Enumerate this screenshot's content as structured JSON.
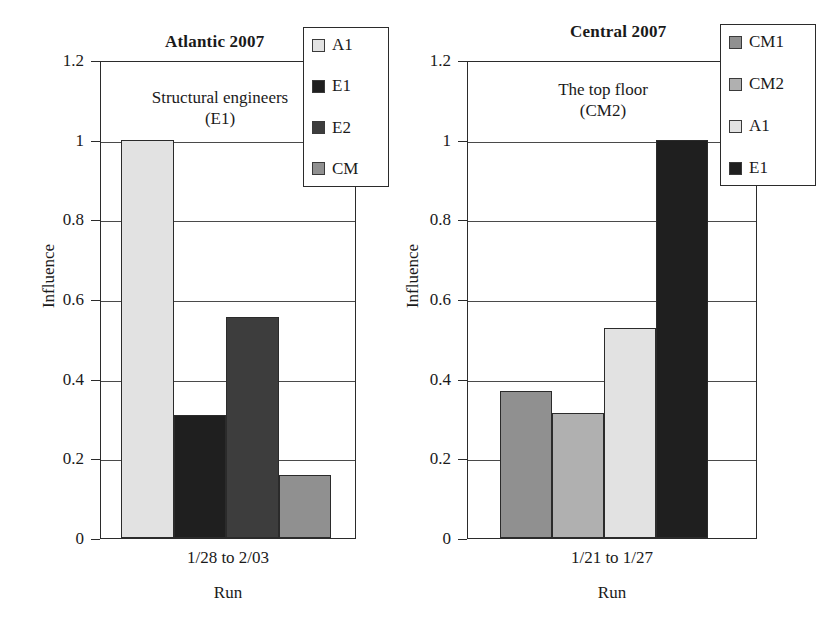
{
  "figure": {
    "background": "#ffffff",
    "panels": [
      "atlantic",
      "central"
    ]
  },
  "chart_data": [
    {
      "type": "bar",
      "title": "Atlantic 2007",
      "xlabel": "Run",
      "ylabel": "Influence",
      "categories": [
        "1/28 to 2/03"
      ],
      "x_tick_labels": [
        "1/28 to 2/03"
      ],
      "y_tick_labels": [
        "0",
        "0.2",
        "0.4",
        "0.6",
        "0.8",
        "1",
        "1.2"
      ],
      "y_ticks": [
        0,
        0.2,
        0.4,
        0.6,
        0.8,
        1,
        1.2
      ],
      "ylim": [
        0,
        1.2
      ],
      "grid": true,
      "legend_position": "top-right",
      "annotation": [
        "Structural engineers",
        "(E1)"
      ],
      "series": [
        {
          "name": "A1",
          "values": [
            1.0
          ],
          "color": "#e2e2e2"
        },
        {
          "name": "E1",
          "values": [
            0.31
          ],
          "color": "#1f1f1f"
        },
        {
          "name": "E2",
          "values": [
            0.555
          ],
          "color": "#3d3d3d"
        },
        {
          "name": "CM",
          "values": [
            0.157
          ],
          "color": "#909090"
        }
      ]
    },
    {
      "type": "bar",
      "title": "Central 2007",
      "xlabel": "Run",
      "ylabel": "Influence",
      "categories": [
        "1/21 to 1/27"
      ],
      "x_tick_labels": [
        "1/21 to 1/27"
      ],
      "y_tick_labels": [
        "0",
        "0.2",
        "0.4",
        "0.6",
        "0.8",
        "1",
        "1.2"
      ],
      "y_ticks": [
        0,
        0.2,
        0.4,
        0.6,
        0.8,
        1,
        1.2
      ],
      "ylim": [
        0,
        1.2
      ],
      "grid": true,
      "legend_position": "top-right",
      "annotation": [
        "The top floor",
        "(CM2)"
      ],
      "series": [
        {
          "name": "CM1",
          "values": [
            0.37
          ],
          "color": "#909090"
        },
        {
          "name": "CM2",
          "values": [
            0.315
          ],
          "color": "#b0b0b0"
        },
        {
          "name": "A1",
          "values": [
            0.527
          ],
          "color": "#e2e2e2"
        },
        {
          "name": "E1",
          "values": [
            1.0
          ],
          "color": "#1f1f1f"
        }
      ]
    }
  ]
}
